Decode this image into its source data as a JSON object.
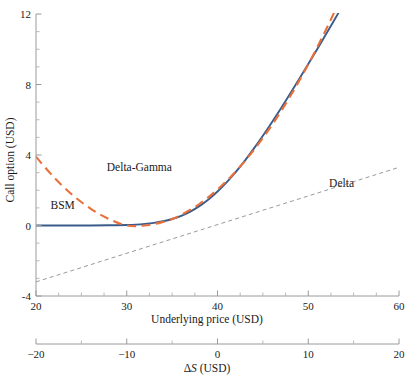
{
  "chart_data": {
    "type": "line",
    "title": "",
    "xlabel": "Underlying price (USD)",
    "ylabel": "Call option (USD)",
    "secondary_xlabel_delta": "Δ",
    "secondary_xlabel_s": "S",
    "secondary_xlabel_unit": " (USD)",
    "xlim": [
      20,
      60
    ],
    "ylim": [
      -4,
      12
    ],
    "secondary_xlim": [
      -20,
      20
    ],
    "grid": false,
    "legend": "inline-labels",
    "xticks": [
      20,
      30,
      40,
      50,
      60
    ],
    "xticklabels": [
      "20",
      "30",
      "40",
      "50",
      "60"
    ],
    "xticks_minor": [
      22.5,
      25,
      27.5,
      32.5,
      35,
      37.5,
      42.5,
      45,
      47.5,
      52.5,
      55,
      57.5
    ],
    "yticks": [
      -4,
      0,
      4,
      8,
      12
    ],
    "yticklabels": [
      "-4",
      "0",
      "4",
      "8",
      "12"
    ],
    "yticks_minor": [
      -3,
      -2,
      -1,
      1,
      2,
      3,
      5,
      6,
      7,
      9,
      10,
      11
    ],
    "secondary_xticks": [
      -20,
      -10,
      0,
      10,
      20
    ],
    "secondary_xticklabels": [
      "−20",
      "−10",
      "0",
      "10",
      "20"
    ],
    "secondary_xticks_minor": [
      -15,
      -5,
      5,
      15
    ],
    "strike_reference": 40,
    "series": [
      {
        "name": "BSM",
        "label": "BSM",
        "color": "#3b5c8a",
        "style": "solid",
        "width": 1.9,
        "x": [
          20,
          22,
          24,
          26,
          28,
          30,
          31,
          32,
          33,
          34,
          35,
          36,
          37,
          38,
          39,
          40,
          41,
          42,
          43,
          44,
          45,
          46,
          47,
          48,
          49,
          50,
          51,
          52,
          53,
          54,
          55,
          56,
          57,
          58,
          59,
          60
        ],
        "y": [
          0.0,
          0.0,
          0.0,
          0.0,
          0.01,
          0.03,
          0.05,
          0.09,
          0.15,
          0.24,
          0.37,
          0.55,
          0.79,
          1.1,
          1.48,
          1.93,
          2.45,
          3.03,
          3.67,
          4.36,
          5.09,
          5.86,
          6.65,
          7.47,
          8.31,
          9.16,
          10.02,
          10.89,
          11.77,
          12.65,
          13.54,
          14.43,
          15.32,
          16.22,
          17.11,
          18.01
        ]
      },
      {
        "name": "Delta-Gamma",
        "label": "Delta-Gamma",
        "color": "#e8703a",
        "style": "dashed",
        "width": 2.1,
        "x": [
          20,
          22,
          24,
          26,
          28,
          30,
          32,
          34,
          35,
          36,
          38,
          40,
          42,
          44,
          46,
          48,
          50,
          52,
          54,
          56,
          58,
          60
        ],
        "y": [
          3.9,
          2.72,
          1.74,
          0.96,
          0.38,
          0.0,
          0.0,
          0.2,
          0.37,
          0.6,
          1.22,
          2.04,
          3.06,
          4.28,
          5.7,
          7.32,
          9.14,
          11.16,
          13.38,
          15.8,
          18.42,
          21.24
        ]
      },
      {
        "name": "Delta",
        "label": "Delta",
        "color": "#9a9a9a",
        "style": "dashed-thin",
        "width": 1.0,
        "x": [
          20,
          60
        ],
        "y": [
          -3.2,
          3.3
        ]
      }
    ],
    "annotations": [
      {
        "text": "Delta-Gamma",
        "x": 27.8,
        "y": 3.12,
        "name": "delta-gamma-label"
      },
      {
        "text": "BSM",
        "x": 21.6,
        "y": 0.95,
        "name": "bsm-label"
      },
      {
        "text": "Delta",
        "x": 52.3,
        "y": 2.2,
        "name": "delta-label"
      }
    ]
  }
}
